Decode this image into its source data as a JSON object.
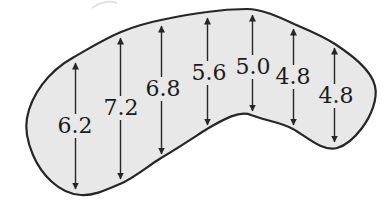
{
  "figure": {
    "type": "labeled-region-diagram",
    "measurements": [
      "6.2",
      "7.2",
      "6.8",
      "5.6",
      "5.0",
      "4.8",
      "4.8"
    ]
  },
  "colors": {
    "page_bg": "#ffffff",
    "region_fill": "#e8e8e8",
    "outline_ink": "#262626",
    "label_ink": "#1c1c1c"
  }
}
